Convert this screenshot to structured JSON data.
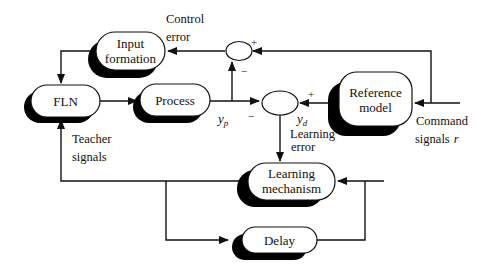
{
  "diagram": {
    "type": "block-diagram",
    "blocks": {
      "input_formation": {
        "line1": "Input",
        "line2": "formation"
      },
      "fln": {
        "label": "FLN"
      },
      "process": {
        "label": "Process"
      },
      "reference_model": {
        "line1": "Reference",
        "line2": "model"
      },
      "learning_mechanism": {
        "line1": "Learning",
        "line2": "mechanism"
      },
      "delay": {
        "label": "Delay"
      }
    },
    "summing_junctions": {
      "control": {
        "plus": "+",
        "minus": "−"
      },
      "learning": {
        "plus": "+",
        "minus": "−"
      }
    },
    "labels": {
      "control_error_1": "Control",
      "control_error_2": "error",
      "yp": "y",
      "yp_sub": "p",
      "yd": "y",
      "yd_sub": "d",
      "learning_error_1": "Learning",
      "learning_error_2": "error",
      "teacher_1": "Teacher",
      "teacher_2": "signals",
      "command_1": "Command",
      "command_2": "signals",
      "command_r": "r"
    },
    "colors": {
      "line": "#111111",
      "shadow": "#000000",
      "fill": "#ffffff"
    }
  }
}
